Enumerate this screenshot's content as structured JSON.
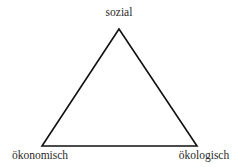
{
  "diagram": {
    "type": "triangle",
    "vertices": [
      {
        "id": "top",
        "label": "sozial"
      },
      {
        "id": "bottom-left",
        "label": "ökonomisch"
      },
      {
        "id": "bottom-right",
        "label": "ökologisch"
      }
    ],
    "stroke_color": "#111111",
    "background": "#ffffff"
  }
}
